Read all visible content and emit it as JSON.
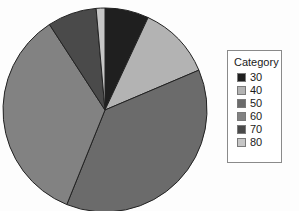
{
  "chart_data": {
    "type": "pie",
    "title": "",
    "legend_title": "Category",
    "legend_position": "right",
    "categories": [
      "30",
      "40",
      "50",
      "60",
      "70",
      "80"
    ],
    "values": [
      7.0,
      11.7,
      37.5,
      34.7,
      7.9,
      1.2
    ],
    "start_angle_deg": 0,
    "direction": "clockwise",
    "slice_angles_deg": [
      25,
      42,
      135,
      125,
      28,
      5
    ],
    "colors": [
      "#1f1f1f",
      "#b3b3b3",
      "#6b6b6b",
      "#828282",
      "#4a4a4a",
      "#c6c6c6"
    ],
    "slice_border_color": "#222222",
    "grid": false,
    "xlabel": "",
    "ylabel": ""
  },
  "legend": {
    "title": "Category",
    "items": [
      {
        "label": "30",
        "color": "#1f1f1f"
      },
      {
        "label": "40",
        "color": "#b3b3b3"
      },
      {
        "label": "50",
        "color": "#6b6b6b"
      },
      {
        "label": "60",
        "color": "#828282"
      },
      {
        "label": "70",
        "color": "#4a4a4a"
      },
      {
        "label": "80",
        "color": "#c6c6c6"
      }
    ]
  },
  "pie": {
    "center_x": 105,
    "center_y": 110,
    "radius": 102
  }
}
